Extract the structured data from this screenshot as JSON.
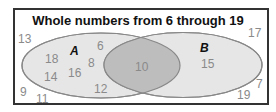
{
  "title": "Whole numbers from 6 through 19",
  "sets": {
    "A": {
      "label": "A",
      "x": 70,
      "y": 44
    },
    "B": {
      "label": "B",
      "x": 200,
      "y": 41
    }
  },
  "colors": {
    "border": "#333333",
    "ellipse_fill": "#e6e6e6",
    "overlap_fill": "#bdbdbd",
    "ellipse_stroke": "#888888",
    "number_text": "#8a8a8a"
  },
  "regions": {
    "only_A": [
      "18",
      "14",
      "16",
      "8",
      "6",
      "12"
    ],
    "A_and_B": [
      "10"
    ],
    "only_B": [
      "15"
    ],
    "outside": [
      "13",
      "9",
      "11",
      "17",
      "7",
      "19"
    ]
  },
  "numbers": [
    {
      "value": "13",
      "x": 18,
      "y": 32
    },
    {
      "value": "18",
      "x": 45,
      "y": 52
    },
    {
      "value": "14",
      "x": 44,
      "y": 70
    },
    {
      "value": "16",
      "x": 68,
      "y": 66
    },
    {
      "value": "6",
      "x": 97,
      "y": 39
    },
    {
      "value": "8",
      "x": 88,
      "y": 56
    },
    {
      "value": "12",
      "x": 94,
      "y": 82
    },
    {
      "value": "10",
      "x": 135,
      "y": 60
    },
    {
      "value": "15",
      "x": 201,
      "y": 57
    },
    {
      "value": "17",
      "x": 248,
      "y": 26
    },
    {
      "value": "7",
      "x": 256,
      "y": 77
    },
    {
      "value": "19",
      "x": 237,
      "y": 88
    },
    {
      "value": "9",
      "x": 20,
      "y": 85
    },
    {
      "value": "11",
      "x": 36,
      "y": 92
    }
  ]
}
